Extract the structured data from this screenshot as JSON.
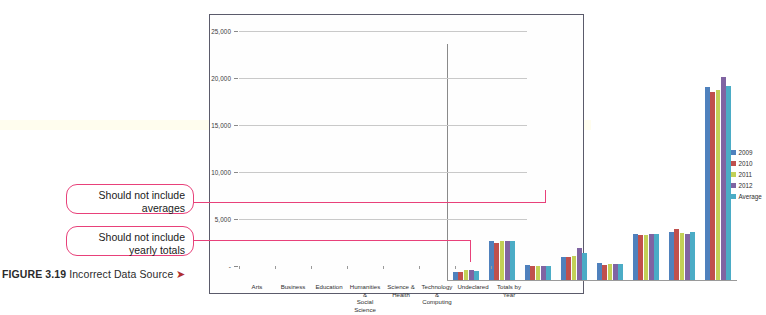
{
  "figure": {
    "label": "FIGURE 3.19",
    "title": "Incorrect Data Source",
    "arrow_glyph": "➤"
  },
  "annotations": [
    {
      "name": "should-not-include-averages",
      "line1": "Should not include",
      "line2": "averages"
    },
    {
      "name": "should-not-include-yearly-totals",
      "line1": "Should not include",
      "line2": "yearly totals"
    }
  ],
  "chart_data": {
    "type": "bar",
    "title": "",
    "subtitle": "",
    "xlabel": "",
    "ylabel": "",
    "ylim": [
      0,
      25000
    ],
    "grid": true,
    "legend_position": "right",
    "y_ticks": [
      "-",
      "5,000",
      "10,000",
      "15,000",
      "20,000",
      "25,000"
    ],
    "y_tick_values": [
      0,
      5000,
      10000,
      15000,
      20000,
      25000
    ],
    "categories": [
      "Arts",
      "Business",
      "Education",
      "Humanities & Social Science",
      "Science & Health",
      "Technology & Computing",
      "Undeclared",
      "Totals by Year"
    ],
    "category_lines": [
      [
        "Arts"
      ],
      [
        "Business"
      ],
      [
        "Education"
      ],
      [
        "Humanities &",
        "Social Science"
      ],
      [
        "Science &",
        "Health"
      ],
      [
        "Technology &",
        "Computing"
      ],
      [
        "Undeclared"
      ],
      [
        "Totals by Year"
      ]
    ],
    "series": [
      {
        "name": "2009",
        "color": "#4f81bd",
        "values": [
          850,
          4150,
          1550,
          2500,
          1800,
          4900,
          5150,
          20500
        ]
      },
      {
        "name": "2010",
        "color": "#c0504d",
        "values": [
          900,
          3950,
          1500,
          2450,
          1650,
          4750,
          5400,
          20000
        ]
      },
      {
        "name": "2011",
        "color": "#c3d157",
        "values": [
          1050,
          4100,
          1500,
          2600,
          1700,
          4750,
          5050,
          20200
        ]
      },
      {
        "name": "2012",
        "color": "#8064a2",
        "values": [
          1100,
          4200,
          1500,
          3400,
          1750,
          4900,
          4850,
          21600
        ]
      },
      {
        "name": "Average",
        "color": "#4bacc6",
        "values": [
          950,
          4100,
          1500,
          2900,
          1750,
          4850,
          5150,
          20600
        ]
      }
    ]
  },
  "colors": {
    "annotation_pink": "#e8417a",
    "frame_border": "#5b5b6b",
    "top_rule": "#7b74c9",
    "caption_text": "#2b2b2b",
    "caption_arrow": "#b03030"
  }
}
